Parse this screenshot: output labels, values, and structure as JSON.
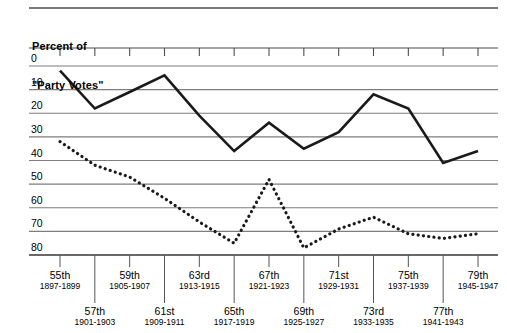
{
  "axis_title": {
    "line1": "Percent of",
    "line2": "\"Party Votes\""
  },
  "y_ticks": [
    "80",
    "70",
    "60",
    "50",
    "40",
    "30",
    "20",
    "10",
    "0"
  ],
  "x_categories": [
    {
      "name": "55th",
      "years": "1897-1899",
      "row": "top"
    },
    {
      "name": "57th",
      "years": "1901-1903",
      "row": "bottom"
    },
    {
      "name": "59th",
      "years": "1905-1907",
      "row": "top"
    },
    {
      "name": "61st",
      "years": "1909-1911",
      "row": "bottom"
    },
    {
      "name": "63rd",
      "years": "1913-1915",
      "row": "top"
    },
    {
      "name": "65th",
      "years": "1917-1919",
      "row": "bottom"
    },
    {
      "name": "67th",
      "years": "1921-1923",
      "row": "top"
    },
    {
      "name": "69th",
      "years": "1925-1927",
      "row": "bottom"
    },
    {
      "name": "71st",
      "years": "1929-1931",
      "row": "top"
    },
    {
      "name": "73rd",
      "years": "1933-1935",
      "row": "bottom"
    },
    {
      "name": "75th",
      "years": "1937-1939",
      "row": "top"
    },
    {
      "name": "77th",
      "years": "1941-1943",
      "row": "bottom"
    },
    {
      "name": "79th",
      "years": "1945-1947",
      "row": "top"
    }
  ],
  "colors": {
    "line_solid": "#1a1a1a",
    "line_dotted": "#1a1a1a",
    "gridline": "#7d7d7d",
    "axis": "#4d4d4d",
    "background": "#ffffff"
  },
  "chart_data": {
    "type": "line",
    "title": "",
    "xlabel": "",
    "ylabel": "Percent of \"Party Votes\"",
    "ylim": [
      0,
      85
    ],
    "yticks": [
      0,
      10,
      20,
      30,
      40,
      50,
      60,
      70,
      80
    ],
    "grid": true,
    "legend": "none",
    "categories": [
      "55th",
      "57th",
      "59th",
      "61st",
      "63rd",
      "65th",
      "67th",
      "69th",
      "71st",
      "73rd",
      "75th",
      "77th",
      "79th"
    ],
    "x_year_ranges": [
      "1897-1899",
      "1901-1903",
      "1905-1907",
      "1909-1911",
      "1913-1915",
      "1917-1919",
      "1921-1923",
      "1925-1927",
      "1929-1931",
      "1933-1935",
      "1937-1939",
      "1941-1943",
      "1945-1947"
    ],
    "series": [
      {
        "name": "Solid line",
        "style": "solid",
        "values": [
          78,
          62,
          69,
          76,
          59,
          44,
          56,
          45,
          52,
          68,
          62,
          39,
          44
        ]
      },
      {
        "name": "Dotted line",
        "style": "dotted",
        "values": [
          48,
          38,
          33,
          24,
          14,
          5,
          32,
          3,
          11,
          16,
          9,
          7,
          9
        ]
      }
    ]
  }
}
